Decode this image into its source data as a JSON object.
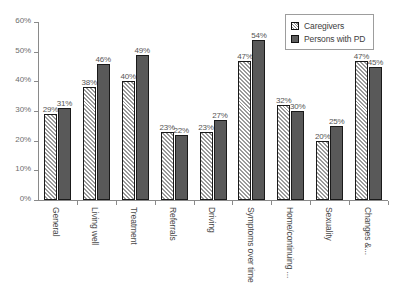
{
  "chart_data": {
    "type": "bar",
    "title": "",
    "xlabel": "",
    "ylabel": "",
    "ylim": [
      0,
      60
    ],
    "ytick_labels": [
      "0%",
      "10%",
      "20%",
      "30%",
      "40%",
      "50%",
      "60%"
    ],
    "ytick_values": [
      0,
      10,
      20,
      30,
      40,
      50,
      60
    ],
    "grid": false,
    "legend_position": "top-right",
    "categories": [
      "General",
      "Living well",
      "Treatment",
      "Referrals",
      "Driving",
      "Symptoms over time",
      "Home/continuing ...",
      "Sexuality",
      "Changes &..."
    ],
    "series": [
      {
        "name": "Caregivers",
        "values": [
          29,
          38,
          40,
          23,
          23,
          47,
          32,
          20,
          47
        ],
        "value_labels": [
          "29%",
          "38%",
          "40%",
          "23%",
          "23%",
          "47%",
          "32%",
          "20%",
          "47%"
        ],
        "color": "#ffffff",
        "pattern": "diagonal-hatch"
      },
      {
        "name": "Persons with PD",
        "values": [
          31,
          46,
          49,
          22,
          27,
          54,
          30,
          25,
          45
        ],
        "value_labels": [
          "31%",
          "46%",
          "49%",
          "22%",
          "27%",
          "54%",
          "30%",
          "25%",
          "45%"
        ],
        "color": "#595959",
        "pattern": "solid"
      }
    ]
  },
  "legend": {
    "items": [
      {
        "label": "Caregivers"
      },
      {
        "label": "Persons with PD"
      }
    ]
  }
}
